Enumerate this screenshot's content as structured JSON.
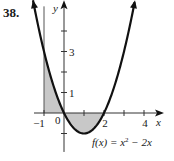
{
  "problem_number": "38.",
  "chart_data": {
    "type": "line",
    "title": "",
    "function_label": "f(x) = x² − 2x",
    "function_label_parts": {
      "prefix": "f(x) = x",
      "exponent": "2",
      "suffix": " − 2x"
    },
    "xlabel": "x",
    "ylabel": "y",
    "xlim": [
      -1.7,
      4.7
    ],
    "ylim": [
      -1.9,
      5.3
    ],
    "x_ticks": [
      -1,
      1,
      2,
      3,
      4
    ],
    "x_tick_labels": [
      {
        "value": -1,
        "label": "−1"
      },
      {
        "value": 2,
        "label": "2"
      },
      {
        "value": 4,
        "label": "4"
      }
    ],
    "y_ticks": [
      -1,
      1,
      2,
      3,
      4
    ],
    "y_tick_labels": [
      {
        "value": 1,
        "label": "1"
      },
      {
        "value": 3,
        "label": "3"
      }
    ],
    "origin_label": "0",
    "series": [
      {
        "name": "f(x) = x^2 - 2x",
        "expression": "x^2 - 2x",
        "x_range": [
          -1.55,
          3.55
        ],
        "color": "#111111"
      }
    ],
    "shaded_region": {
      "between": "f(x) and x-axis",
      "x_from": -1,
      "x_to": 2,
      "color": "#c8c8c8"
    },
    "vertical_line": {
      "x": -1
    },
    "grid": false,
    "legend": "none"
  }
}
